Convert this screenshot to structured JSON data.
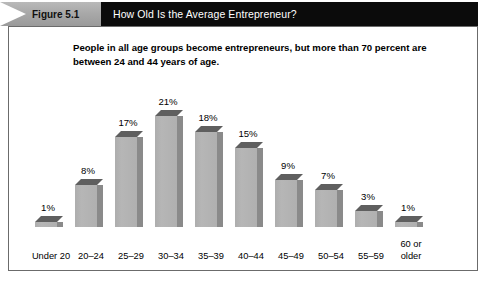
{
  "figure": {
    "tag_label": "Figure 5.1",
    "title": "How Old Is the Average Entrepreneur?",
    "subtitle": "People in all age groups become entrepreneurs, but more than 70 percent are between 24 and 44 years of age.",
    "colors": {
      "header_bar": "#0b0b0b",
      "ribbon": "#a9a9a9",
      "frame_border": "#6b6b6b",
      "bar_front": "#b0b0b0",
      "bar_side": "#8a8a8a",
      "bar_top": "#5f5f5f",
      "text": "#000000",
      "title_text": "#ffffff"
    }
  },
  "chart_data": {
    "type": "bar",
    "title": "How Old Is the Average Entrepreneur?",
    "subtitle": "People in all age groups become entrepreneurs, but more than 70 percent are between 24 and 44 years of age.",
    "xlabel": "",
    "ylabel": "",
    "ylim": [
      0,
      22
    ],
    "grid": false,
    "legend": false,
    "categories": [
      "Under 20",
      "20–24",
      "25–29",
      "30–34",
      "35–39",
      "40–44",
      "45–49",
      "50–54",
      "55–59",
      "60 or older"
    ],
    "values": [
      1,
      8,
      17,
      21,
      18,
      15,
      9,
      7,
      3,
      1
    ],
    "data_labels": [
      "1%",
      "8%",
      "17%",
      "21%",
      "18%",
      "15%",
      "9%",
      "7%",
      "3%",
      "1%"
    ]
  }
}
